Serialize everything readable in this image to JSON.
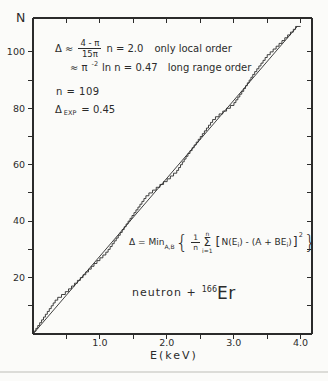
{
  "colors": {
    "ink": "#2b2b2b",
    "background": "#fbfbf9",
    "scan_line": "#dcdcd8"
  },
  "figure": {
    "y_axis_title": "N",
    "x_axis_title": "E(keV)"
  },
  "annotations": {
    "local_order": {
      "lead": "Δ ≈",
      "frac_num": "4 - π",
      "frac_den": "15π",
      "eq": "n = 2.0",
      "note": "only local order"
    },
    "long_range": {
      "lead": "≈ π",
      "exp": "-2",
      "eq": "ln n = 0.47",
      "note": "long range order"
    },
    "n_levels": "n = 109",
    "delta_exp": {
      "lead": "Δ",
      "sub": "EXP",
      "eq": "= 0.45"
    },
    "min_formula": {
      "lhs": "Δ = Min",
      "sub": "A,B",
      "brace_open": "{",
      "frac_num": "1",
      "frac_den": "n",
      "sum_top": "n",
      "sum": "Σ",
      "sum_bot": "i=1",
      "bracket_open": "[",
      "term1": "N(E",
      "idx1": "i",
      "term2": ") - (A + BE",
      "idx2": "i",
      "term3": ")",
      "bracket_close": "]",
      "power": "2",
      "brace_close": "}"
    },
    "reaction": {
      "prefix": "neutron +",
      "mass": "166",
      "element": "Er"
    }
  },
  "chart_data": {
    "type": "line",
    "subtype": "staircase-with-least-squares-fit",
    "title": "",
    "xlabel": "E(keV)",
    "ylabel": "N",
    "xlim": [
      0,
      4.17
    ],
    "ylim": [
      0,
      112
    ],
    "grid": false,
    "legend": "none",
    "x_major_ticks": [
      1.0,
      2.0,
      3.0,
      4.0
    ],
    "x_major_tick_labels": [
      "1.0",
      "2.0",
      "3.0",
      "4.0"
    ],
    "x_minor_ticks": [
      0.5,
      1.5,
      2.5,
      3.5
    ],
    "y_ticks": [
      10,
      20,
      30,
      40,
      50,
      60,
      70,
      80,
      90,
      100
    ],
    "y_labeled_ticks": [
      20,
      40,
      60,
      80,
      100
    ],
    "series": [
      {
        "name": "N(E) cumulative resonance count (staircase)",
        "type": "step",
        "n_levels": 109,
        "E_start": 0,
        "E_end": 3.95,
        "deviation_profile": [
          [
            0,
            0
          ],
          [
            0.2,
            1.5
          ],
          [
            0.35,
            2.5
          ],
          [
            0.5,
            1.0
          ],
          [
            0.7,
            0
          ],
          [
            0.9,
            -0.6
          ],
          [
            1.1,
            -1.6
          ],
          [
            1.3,
            -0.5
          ],
          [
            1.5,
            0.8
          ],
          [
            1.7,
            2.0
          ],
          [
            1.85,
            0.6
          ],
          [
            2.0,
            -0.8
          ],
          [
            2.15,
            -1.8
          ],
          [
            2.3,
            -0.5
          ],
          [
            2.5,
            0.5
          ],
          [
            2.7,
            1.5
          ],
          [
            2.85,
            0.1
          ],
          [
            3.0,
            -1.4
          ],
          [
            3.15,
            -0.4
          ],
          [
            3.3,
            1.0
          ],
          [
            3.5,
            1.9
          ],
          [
            3.7,
            0.9
          ],
          [
            3.9,
            0.1
          ],
          [
            3.95,
            0.3
          ]
        ]
      },
      {
        "name": "least-squares straight line A + BE",
        "type": "line",
        "points": [
          [
            0,
            0
          ],
          [
            3.95,
            109
          ]
        ]
      }
    ]
  }
}
